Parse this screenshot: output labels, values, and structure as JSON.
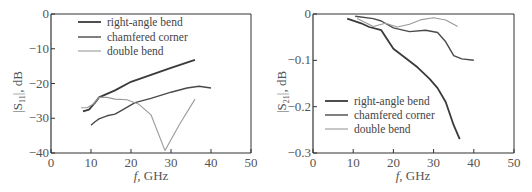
{
  "chart_data": [
    {
      "type": "line",
      "title": "",
      "xlabel": "f, GHz",
      "ylabel": "|S11|, dB",
      "xlim": [
        0,
        50
      ],
      "ylim": [
        -40,
        0
      ],
      "xticks": [
        0,
        10,
        20,
        30,
        40,
        50
      ],
      "yticks": [
        0,
        -10,
        -20,
        -30,
        -40
      ],
      "grid": false,
      "legend_position": "upper-left",
      "series": [
        {
          "name": "right-angle bend",
          "color": "#3a3a3a",
          "width": 1.8,
          "points": [
            [
              8,
              -28
            ],
            [
              9.5,
              -27.5
            ],
            [
              11,
              -25.5
            ],
            [
              12,
              -24
            ],
            [
              14,
              -23
            ],
            [
              16,
              -22
            ],
            [
              20,
              -19.5
            ],
            [
              25,
              -17.5
            ],
            [
              30,
              -15.5
            ],
            [
              36,
              -13.2
            ]
          ]
        },
        {
          "name": "chamfered corner",
          "color": "#4a4a4a",
          "width": 1.4,
          "points": [
            [
              10,
              -32
            ],
            [
              11,
              -31
            ],
            [
              12,
              -30.2
            ],
            [
              14,
              -29.3
            ],
            [
              16,
              -28.8
            ],
            [
              18,
              -27.5
            ],
            [
              21,
              -25.5
            ],
            [
              25,
              -24.3
            ],
            [
              30,
              -22.5
            ],
            [
              34,
              -21.3
            ],
            [
              37,
              -20.8
            ],
            [
              40,
              -21.3
            ]
          ]
        },
        {
          "name": "double bend",
          "color": "#9a9a9a",
          "width": 1.1,
          "points": [
            [
              7.5,
              -27
            ],
            [
              9,
              -27
            ],
            [
              10.5,
              -26
            ],
            [
              12,
              -24
            ],
            [
              14,
              -24
            ],
            [
              16,
              -24.5
            ],
            [
              19,
              -24.7
            ],
            [
              22,
              -26
            ],
            [
              25,
              -29
            ],
            [
              28.5,
              -39.3
            ],
            [
              32,
              -32
            ],
            [
              36,
              -24.5
            ]
          ]
        }
      ]
    },
    {
      "type": "line",
      "title": "",
      "xlabel": "f, GHz",
      "ylabel": "|S21|, dB",
      "xlim": [
        0,
        50
      ],
      "ylim": [
        -0.3,
        0
      ],
      "xticks": [
        0,
        10,
        20,
        30,
        40,
        50
      ],
      "yticks": [
        0,
        -0.1,
        -0.2,
        -0.3
      ],
      "grid": false,
      "legend_position": "lower-left",
      "series": [
        {
          "name": "right-angle bend",
          "color": "#3a3a3a",
          "width": 1.8,
          "points": [
            [
              8.5,
              -0.01
            ],
            [
              12,
              -0.02
            ],
            [
              14,
              -0.028
            ],
            [
              17,
              -0.035
            ],
            [
              20,
              -0.075
            ],
            [
              23,
              -0.095
            ],
            [
              26,
              -0.115
            ],
            [
              29,
              -0.14
            ],
            [
              31,
              -0.16
            ],
            [
              33,
              -0.19
            ],
            [
              35,
              -0.24
            ],
            [
              36.5,
              -0.27
            ]
          ]
        },
        {
          "name": "chamfered corner",
          "color": "#4a4a4a",
          "width": 1.4,
          "points": [
            [
              10.5,
              -0.005
            ],
            [
              15,
              -0.01
            ],
            [
              17,
              -0.015
            ],
            [
              20,
              -0.03
            ],
            [
              24,
              -0.038
            ],
            [
              28,
              -0.035
            ],
            [
              31,
              -0.04
            ],
            [
              33,
              -0.06
            ],
            [
              35,
              -0.09
            ],
            [
              37,
              -0.097
            ],
            [
              40,
              -0.1
            ]
          ]
        },
        {
          "name": "double bend",
          "color": "#9a9a9a",
          "width": 1.1,
          "points": [
            [
              11,
              -0.01
            ],
            [
              15,
              -0.027
            ],
            [
              18,
              -0.02
            ],
            [
              21,
              -0.028
            ],
            [
              24,
              -0.022
            ],
            [
              27,
              -0.012
            ],
            [
              30,
              -0.008
            ],
            [
              33,
              -0.013
            ],
            [
              36,
              -0.027
            ]
          ]
        }
      ]
    }
  ],
  "left": {
    "ylabel_main": "|S",
    "ylabel_sub": "11",
    "ylabel_tail": "|, dB",
    "xlabel_f": "f",
    "xlabel_tail": ", GHz",
    "yticks": [
      "0",
      "−10",
      "−20",
      "−30",
      "−40"
    ],
    "xticks": [
      "0",
      "10",
      "20",
      "30",
      "40",
      "50"
    ],
    "legend": [
      "right-angle bend",
      "chamfered corner",
      "double bend"
    ]
  },
  "right": {
    "ylabel_main": "|S",
    "ylabel_sub": "21",
    "ylabel_tail": "|, dB",
    "xlabel_f": "f",
    "xlabel_tail": ", GHz",
    "yticks": [
      "0",
      "−0.1",
      "−0.2",
      "−0.3"
    ],
    "xticks": [
      "0",
      "10",
      "20",
      "30",
      "40",
      "50"
    ],
    "legend": [
      "right-angle bend",
      "chamfered corner",
      "double bend"
    ]
  }
}
